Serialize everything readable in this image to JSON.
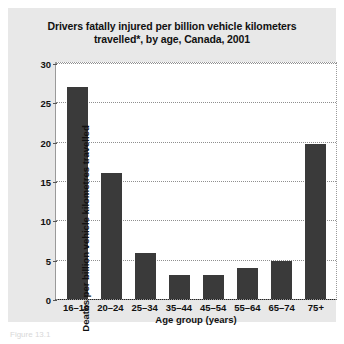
{
  "figure": {
    "title": "Drivers fatally injured per billion vehicle kilometers travelled*, by age, Canada, 2001",
    "caption": "Figure 13.1",
    "panel_color": "#e8e8e8",
    "bar_color": "#3a3a3a",
    "plot_background": "#ffffff"
  },
  "chart_data": {
    "type": "bar",
    "title": "Drivers fatally injured per billion vehicle kilometers travelled*, by age, Canada, 2001",
    "xlabel": "Age group (years)",
    "ylabel": "Deaths per billion vehicle kilometres travelled",
    "categories": [
      "16–19",
      "20–24",
      "25–34",
      "35–44",
      "45–54",
      "55–64",
      "65–74",
      "75+"
    ],
    "values": [
      27,
      16,
      5.8,
      3,
      3,
      4,
      4.8,
      19.7
    ],
    "ylim": [
      0,
      30
    ],
    "yticks": [
      0,
      5,
      10,
      15,
      20,
      25,
      30
    ],
    "ytick_labels": [
      "0",
      "5",
      "10",
      "15",
      "20",
      "25",
      "30"
    ],
    "grid": true,
    "legend": null
  }
}
